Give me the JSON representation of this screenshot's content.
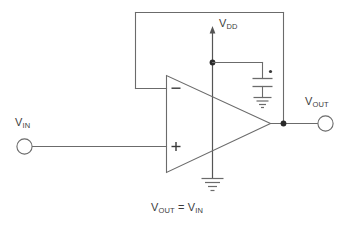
{
  "figure": {
    "caption_prefix": "V",
    "caption": "VOUT = VIN"
  },
  "labels": {
    "vdd": {
      "base": "V",
      "sub": "DD",
      "full": "VDD"
    },
    "vin": {
      "base": "V",
      "sub": "IN",
      "full": "VIN"
    },
    "vout": {
      "base": "V",
      "sub": "OUT",
      "full": "VOUT"
    }
  },
  "equation": {
    "left_base": "V",
    "left_sub": "OUT",
    "operator": " = ",
    "right_base": "V",
    "right_sub": "IN"
  },
  "opamp": {
    "inverting_sign": "–",
    "noninverting_sign": "+",
    "inverting_input_name": "inverting-input",
    "noninverting_input_name": "non-inverting-input",
    "output_name": "opamp-output"
  },
  "components": [
    {
      "name": "op-amp",
      "type": "triangle",
      "label": ""
    },
    {
      "name": "bypass-capacitor",
      "type": "capacitor",
      "label": ""
    },
    {
      "name": "supply-ground",
      "type": "ground",
      "label": ""
    },
    {
      "name": "capacitor-ground",
      "type": "ground",
      "label": ""
    },
    {
      "name": "input-terminal",
      "type": "terminal",
      "label": ""
    },
    {
      "name": "output-terminal",
      "type": "terminal",
      "label": ""
    },
    {
      "name": "feedback-wire",
      "type": "wire",
      "label": ""
    }
  ],
  "colors": {
    "background": "#ffffff",
    "wire": "#6b6b6b",
    "node": "#2a2a2a",
    "text": "#3c3c3c"
  }
}
